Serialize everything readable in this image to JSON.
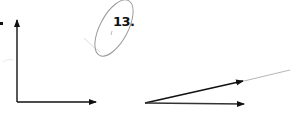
{
  "problem": {
    "number_label": "13.",
    "bullet": "."
  },
  "figures": {
    "left_axes": {
      "description": "Perpendicular vectors (vertical and horizontal arrows from a common origin)",
      "origin": [
        17,
        102
      ],
      "vertical_tip": [
        17,
        19
      ],
      "horizontal_tip": [
        97,
        102
      ]
    },
    "right_vectors": {
      "description": "Two vectors from a common origin at a small angle",
      "origin": [
        145,
        103
      ],
      "upper_tip": [
        244,
        81
      ],
      "upper_extension_end": [
        290,
        71
      ],
      "lower_tip": [
        245,
        104
      ]
    },
    "annotation": {
      "type": "hand-drawn ellipse around problem number",
      "center": [
        112,
        28
      ]
    }
  },
  "colors": {
    "ink": "#111111",
    "pencil": "#9a9a9a",
    "faint": "#d8d8d8"
  }
}
